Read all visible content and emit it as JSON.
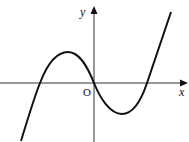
{
  "diagram": {
    "type": "function-graph",
    "labels": {
      "y_axis": "y",
      "x_axis": "x",
      "origin": "O"
    },
    "colors": {
      "curve": "#111111",
      "axes": "#333333",
      "background": "#ffffff"
    },
    "geometry": {
      "origin_px": [
        94,
        83
      ],
      "left_root_px": [
        40,
        83
      ],
      "right_root_px": [
        147,
        83
      ],
      "local_max_px": [
        68,
        52
      ],
      "local_min_px": [
        122,
        114
      ],
      "curve_start_px": [
        21,
        141
      ],
      "curve_end_px": [
        171,
        12
      ]
    }
  }
}
